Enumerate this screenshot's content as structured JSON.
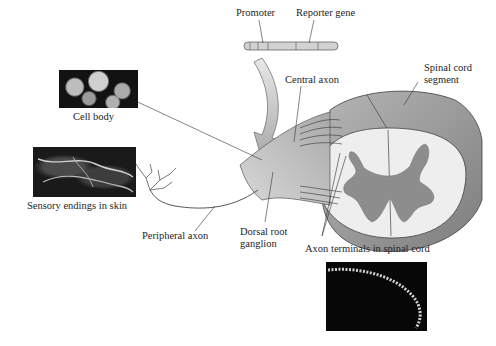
{
  "figure": {
    "labels": {
      "promoter": "Promoter",
      "reporter_gene": "Reporter gene",
      "central_axon": "Central axon",
      "spinal_cord_segment_line1": "Spinal cord",
      "spinal_cord_segment_line2": "segment",
      "cell_body": "Cell body",
      "sensory_endings": "Sensory endings in skin",
      "peripheral_axon": "Peripheral axon",
      "dorsal_root_line1": "Dorsal root",
      "dorsal_root_line2": "ganglion",
      "axon_terminals": "Axon terminals in spinal cord"
    },
    "photos": [
      {
        "name": "cell-body-micrograph",
        "caption": "Cell body"
      },
      {
        "name": "sensory-endings-micrograph",
        "caption": "Sensory endings in skin"
      },
      {
        "name": "axon-terminals-micrograph",
        "caption": "Axon terminals in spinal cord"
      }
    ],
    "colors": {
      "nerve": "#c9c9c9",
      "spinal_cord_outer": "#9a9a9a",
      "white_matter": "#ececec",
      "gray_matter": "#8a8a8a",
      "outline": "#444444"
    }
  }
}
